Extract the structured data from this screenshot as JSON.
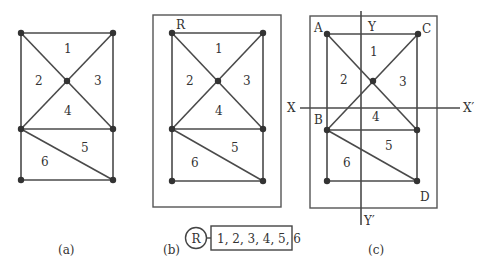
{
  "figure": {
    "panels": [
      {
        "id": "a",
        "caption": "(a)",
        "region_labels": [
          "1",
          "2",
          "3",
          "4",
          "5",
          "6"
        ],
        "vertex_labels": []
      },
      {
        "id": "b",
        "caption": "(b)",
        "region_labels": [
          "1",
          "2",
          "3",
          "4",
          "5",
          "6"
        ],
        "vertex_labels": [
          "R"
        ],
        "tree": {
          "root_label": "R",
          "leaf_content": "1, 2, 3, 4, 5, 6"
        }
      },
      {
        "id": "c",
        "caption": "(c)",
        "region_labels": [
          "1",
          "2",
          "3",
          "4",
          "5",
          "6"
        ],
        "vertex_labels": [
          "A",
          "C",
          "B",
          "D"
        ],
        "axis_labels": {
          "y_top": "Y",
          "y_bottom": "Y′",
          "x_left": "X",
          "x_right": "X′"
        }
      }
    ]
  }
}
